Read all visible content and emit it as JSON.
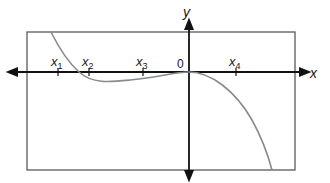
{
  "diagram": {
    "type": "function-graph",
    "axes": {
      "x_label": "x",
      "y_label": "y",
      "origin_label": "0"
    },
    "tick_labels": [
      {
        "base": "x",
        "sub": "1"
      },
      {
        "base": "x",
        "sub": "2"
      },
      {
        "base": "x",
        "sub": "3"
      },
      {
        "base": "x",
        "sub": "4"
      }
    ],
    "colors": {
      "axis": "#111111",
      "frame": "#555555",
      "curve": "#8a8a8a"
    }
  }
}
